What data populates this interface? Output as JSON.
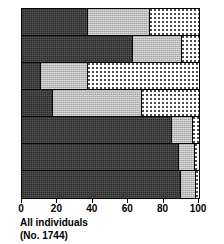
{
  "caption": {
    "line1": "All individuals",
    "line2": "(No. 1744)"
  },
  "axis": {
    "ticks": [
      {
        "value": 0,
        "label": "0"
      },
      {
        "value": 20,
        "label": "20"
      },
      {
        "value": 40,
        "label": "40"
      },
      {
        "value": 60,
        "label": "60"
      },
      {
        "value": 80,
        "label": "80"
      },
      {
        "value": 100,
        "label": "100"
      }
    ]
  },
  "colors": {
    "dark": "#2a2a2a",
    "gray": "#bcbcbc",
    "dotted": "#ffffff",
    "outline": "#000000"
  },
  "chart_data": {
    "type": "bar",
    "orientation": "horizontal",
    "stacked": true,
    "normalized": true,
    "title": "",
    "subtitle": "",
    "xlabel": "",
    "ylabel": "",
    "xlim": [
      0,
      100
    ],
    "xticks": [
      0,
      20,
      40,
      60,
      80,
      100
    ],
    "grid": false,
    "legend": "none",
    "annotations": [
      "All individuals",
      "(No. 1744)"
    ],
    "categories": [
      "row-1",
      "row-2",
      "row-3",
      "row-4",
      "row-5",
      "row-6",
      "row-7"
    ],
    "series": [
      {
        "name": "dark",
        "pattern": "solid-dark",
        "values": [
          37,
          62,
          10,
          17,
          84,
          88,
          89
        ]
      },
      {
        "name": "gray",
        "pattern": "light-gray",
        "values": [
          35,
          28,
          27,
          50,
          12,
          9,
          9
        ]
      },
      {
        "name": "dotted",
        "pattern": "white-dotted",
        "values": [
          28,
          10,
          63,
          33,
          4,
          3,
          2
        ]
      }
    ],
    "rows": [
      {
        "name": "row-1",
        "segments": [
          {
            "series": "dark",
            "value": 37
          },
          {
            "series": "gray",
            "value": 35
          },
          {
            "series": "dotted",
            "value": 28
          }
        ]
      },
      {
        "name": "row-2",
        "segments": [
          {
            "series": "dark",
            "value": 62
          },
          {
            "series": "gray",
            "value": 28
          },
          {
            "series": "dotted",
            "value": 10
          }
        ]
      },
      {
        "name": "row-3",
        "segments": [
          {
            "series": "dark",
            "value": 10
          },
          {
            "series": "gray",
            "value": 27
          },
          {
            "series": "dotted",
            "value": 63
          }
        ]
      },
      {
        "name": "row-4",
        "segments": [
          {
            "series": "dark",
            "value": 17
          },
          {
            "series": "gray",
            "value": 50
          },
          {
            "series": "dotted",
            "value": 33
          }
        ]
      },
      {
        "name": "row-5",
        "segments": [
          {
            "series": "dark",
            "value": 84
          },
          {
            "series": "gray",
            "value": 12
          },
          {
            "series": "dotted",
            "value": 4
          }
        ]
      },
      {
        "name": "row-6",
        "segments": [
          {
            "series": "dark",
            "value": 88
          },
          {
            "series": "gray",
            "value": 9
          },
          {
            "series": "dotted",
            "value": 3
          }
        ]
      },
      {
        "name": "row-7",
        "segments": [
          {
            "series": "dark",
            "value": 89
          },
          {
            "series": "gray",
            "value": 9
          },
          {
            "series": "dotted",
            "value": 2
          }
        ]
      }
    ]
  }
}
